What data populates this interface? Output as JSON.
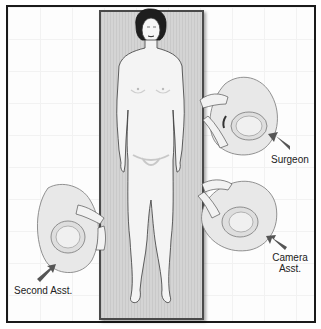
{
  "diagram": {
    "type": "surgical team positioning (top view)",
    "patient": {
      "position": "supine on operating table",
      "orientation": "head at top"
    },
    "labels": {
      "surgeon": "Surgeon",
      "camera_line1": "Camera",
      "camera_line2": "Asst.",
      "second_assistant": "Second Asst."
    },
    "colors": {
      "frame": "#1a1a1a",
      "table": "#cfcfcf",
      "figure_fill": "#ececec",
      "outline": "#333333",
      "arrow": "#555555"
    }
  }
}
